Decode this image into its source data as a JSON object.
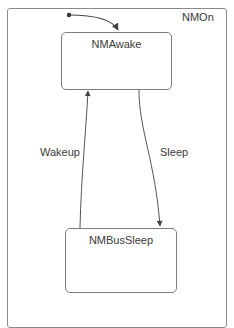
{
  "diagram": {
    "type": "state-machine",
    "container": {
      "label": "NMOn"
    },
    "states": [
      {
        "id": "awake",
        "label": "NMAwake",
        "initial": true
      },
      {
        "id": "bussleep",
        "label": "NMBusSleep",
        "initial": false
      }
    ],
    "transitions": [
      {
        "from": "initial",
        "to": "awake",
        "label": ""
      },
      {
        "from": "awake",
        "to": "bussleep",
        "label": "Sleep"
      },
      {
        "from": "bussleep",
        "to": "awake",
        "label": "Wakeup"
      }
    ],
    "colors": {
      "line": "#555555",
      "border": "#7d7d7d",
      "text": "#3a3a3a"
    }
  }
}
